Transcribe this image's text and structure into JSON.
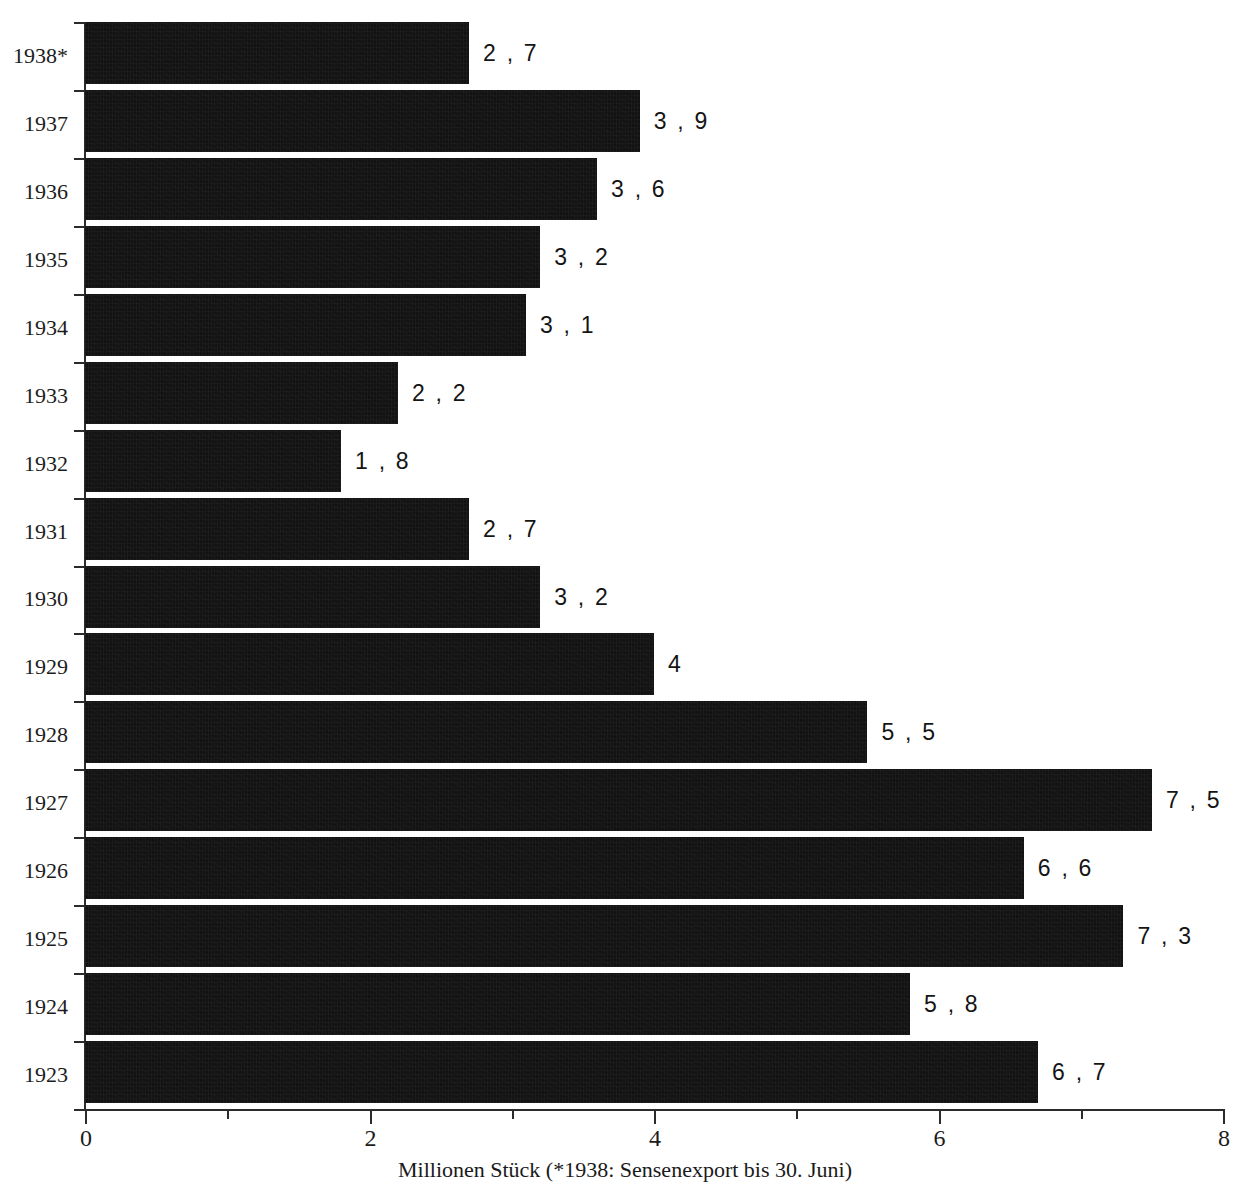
{
  "chart_data": {
    "type": "bar",
    "orientation": "horizontal",
    "title": "",
    "xlabel": "Millionen Stück (*1938: Sensenexport bis 30. Juni)",
    "ylabel": "",
    "xlim": [
      0,
      8
    ],
    "x_major_ticks": [
      "0",
      "2",
      "4",
      "6",
      "8"
    ],
    "x_major_tick_values": [
      0,
      2,
      4,
      6,
      8
    ],
    "x_minor_tick_values": [
      1,
      3,
      5,
      7
    ],
    "grid": false,
    "legend": false,
    "bar_color": "#121212",
    "categories": [
      "1938*",
      "1937",
      "1936",
      "1935",
      "1934",
      "1933",
      "1932",
      "1931",
      "1930",
      "1929",
      "1928",
      "1927",
      "1926",
      "1925",
      "1924",
      "1923"
    ],
    "values": [
      2.7,
      3.9,
      3.6,
      3.2,
      3.1,
      2.2,
      1.8,
      2.7,
      3.2,
      4,
      5.5,
      7.5,
      6.6,
      7.3,
      5.8,
      6.7
    ],
    "data_labels": [
      "2 , 7",
      "3 , 9",
      "3 , 6",
      "3 , 2",
      "3 , 1",
      "2 , 2",
      "1 , 8",
      "2 , 7",
      "3 , 2",
      "4",
      "5 , 5",
      "7 , 5",
      "6 , 6",
      "7 , 3",
      "5 , 8",
      "6 , 7"
    ],
    "bars": [
      {
        "category": "1938*",
        "value": 2.7,
        "label": "2 , 7"
      },
      {
        "category": "1937",
        "value": 3.9,
        "label": "3 , 9"
      },
      {
        "category": "1936",
        "value": 3.6,
        "label": "3 , 6"
      },
      {
        "category": "1935",
        "value": 3.2,
        "label": "3 , 2"
      },
      {
        "category": "1934",
        "value": 3.1,
        "label": "3 , 1"
      },
      {
        "category": "1933",
        "value": 2.2,
        "label": "2 , 2"
      },
      {
        "category": "1932",
        "value": 1.8,
        "label": "1 , 8"
      },
      {
        "category": "1931",
        "value": 2.7,
        "label": "2 , 7"
      },
      {
        "category": "1930",
        "value": 3.2,
        "label": "3 , 2"
      },
      {
        "category": "1929",
        "value": 4.0,
        "label": "4"
      },
      {
        "category": "1928",
        "value": 5.5,
        "label": "5 , 5"
      },
      {
        "category": "1927",
        "value": 7.5,
        "label": "7 , 5"
      },
      {
        "category": "1926",
        "value": 6.6,
        "label": "6 , 6"
      },
      {
        "category": "1925",
        "value": 7.3,
        "label": "7 , 3"
      },
      {
        "category": "1924",
        "value": 5.8,
        "label": "5 , 8"
      },
      {
        "category": "1923",
        "value": 6.7,
        "label": "6 , 7"
      }
    ],
    "footnote": "*1938: Sensenexport bis 30. Juni"
  },
  "top_title_remnant": ""
}
